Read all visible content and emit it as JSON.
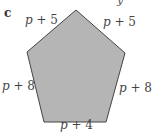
{
  "figure": {
    "part_label": "c",
    "stray_glyph": "y",
    "shape": "pentagon",
    "fill_color": "#b5b5b5",
    "stroke_color": "#444444",
    "vertices": [
      [
        76,
        10
      ],
      [
        125,
        53
      ],
      [
        106,
        122
      ],
      [
        44,
        122
      ],
      [
        27,
        52
      ]
    ],
    "sides": [
      {
        "position": "top-left",
        "label": "p + 5"
      },
      {
        "position": "top-right",
        "label": "p + 5"
      },
      {
        "position": "left",
        "label": "p + 8"
      },
      {
        "position": "right",
        "label": "p + 8"
      },
      {
        "position": "bottom",
        "label": "p + 4"
      }
    ]
  }
}
